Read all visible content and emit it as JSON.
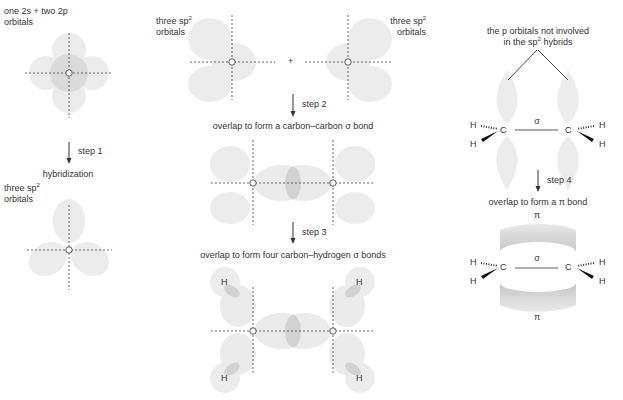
{
  "panels": {
    "left": {
      "top_label_line1": "one 2s + two 2p",
      "top_label_line2": "orbitals",
      "step": "step 1",
      "step_caption": "hybridization",
      "bottom_label_line1": "three sp",
      "bottom_label_sup": "2",
      "bottom_label_line2": "orbitals",
      "atom": "C"
    },
    "middle": {
      "left_label_line1": "three sp",
      "left_label_sup": "2",
      "left_label_line2": "orbitals",
      "right_label_line1": "three sp",
      "right_label_sup": "2",
      "right_label_line2": "orbitals",
      "plus": "+",
      "step2": "step 2",
      "step2_caption": "overlap to form a carbon–carbon σ bond",
      "step3": "step 3",
      "step3_caption": "overlap to form four carbon–hydrogen σ bonds",
      "hydrogen": "H",
      "atom": "C"
    },
    "right": {
      "top_label_line1": "the p orbitals not involved",
      "top_label_line2_pre": "in the sp",
      "top_label_sup": "2",
      "top_label_line2_post": " hybrids",
      "sigma": "σ",
      "step4": "step 4",
      "step4_caption": "overlap to form a π bond",
      "pi": "π",
      "hydrogen": "H",
      "carbon": "C"
    }
  },
  "colors": {
    "orbital_light": "#ebebeb",
    "orbital_mid": "#dcdcdc",
    "orbital_dark": "#c8c8c8",
    "text": "#333333",
    "axis": "#444444"
  }
}
